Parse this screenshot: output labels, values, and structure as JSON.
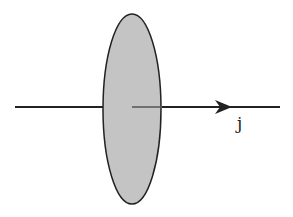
{
  "diagram": {
    "surface": {
      "fill": "#c4c4c4",
      "stroke": "#222222"
    },
    "arrow": {
      "label": "j",
      "color": "#222222"
    }
  }
}
